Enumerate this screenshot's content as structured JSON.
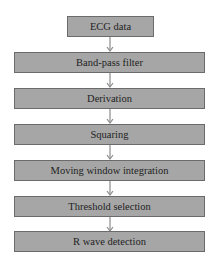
{
  "diagram": {
    "type": "flowchart",
    "direction": "top-to-bottom",
    "colors": {
      "box_fill": "#a6a6a6",
      "box_border": "#6b6b6b",
      "arrow": "#8c8c8c",
      "text": "#1e1e1e",
      "background": "#ffffff"
    },
    "steps": [
      {
        "label": "ECG data"
      },
      {
        "label": "Band-pass filter"
      },
      {
        "label": "Derivation"
      },
      {
        "label": "Squaring"
      },
      {
        "label": "Moving window integration"
      },
      {
        "label": "Threshold selection"
      },
      {
        "label": "R wave detection"
      }
    ],
    "edges": [
      {
        "from": "ECG data",
        "to": "Band-pass filter"
      },
      {
        "from": "Band-pass filter",
        "to": "Derivation"
      },
      {
        "from": "Derivation",
        "to": "Squaring"
      },
      {
        "from": "Squaring",
        "to": "Moving window integration"
      },
      {
        "from": "Moving window integration",
        "to": "Threshold selection"
      },
      {
        "from": "Threshold selection",
        "to": "R wave detection"
      }
    ]
  }
}
